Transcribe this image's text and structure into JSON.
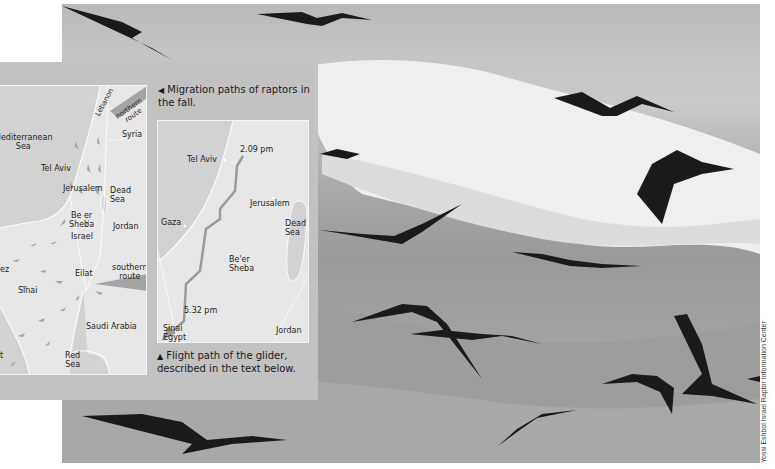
{
  "photo": {
    "subject": "flock of raptors flying over snow-capped mountain",
    "credit": "Yossi Eshbol Israel Raptor Information Center"
  },
  "panel": {
    "migration_caption": {
      "icon": "triangle-left-icon",
      "glyph": "◀",
      "text": "Migration paths of raptors in the fall."
    },
    "glider_caption": {
      "icon": "triangle-up-icon",
      "glyph": "▲",
      "text": "Flight path of the glider, described in the text below."
    }
  },
  "migration_map": {
    "labels": {
      "lebanon": "Lebanon",
      "northern_route_1": "northern",
      "northern_route_2": "route",
      "syria": "Syria",
      "mediterranean_1": "Mediterranean",
      "mediterranean_2": "Sea",
      "tel_aviv": "Tel Aviv",
      "jerusalem": "Jerusalem",
      "dead_sea_1": "Dead",
      "dead_sea_2": "Sea",
      "beer_sheba_1": "Be er",
      "beer_sheba_2": "Sheba",
      "jordan": "Jordan",
      "israel": "Israel",
      "suez": "ez",
      "eilat": "Eilat",
      "southern_route_1": "southern",
      "southern_route_2": "route",
      "sinai": "Sinai",
      "saudi_arabia": "Saudi Arabia",
      "red_sea_1": "Red",
      "red_sea_2": "Sea",
      "partial": "t"
    }
  },
  "glider_map": {
    "labels": {
      "start_time": "2.09 pm",
      "tel_aviv": "Tel Aviv",
      "jerusalem": "Jerusalem",
      "gaza": "Gaza",
      "dead_sea_1": "Dead",
      "dead_sea_2": "Sea",
      "beer_sheba_1": "Be'er",
      "beer_sheba_2": "Sheba",
      "end_time": "5.32 pm",
      "sinai": "Sinai",
      "egypt": "Egypt",
      "jordan": "Jordan"
    }
  },
  "colors": {
    "panel": "#c2c2c2",
    "map_land": "#e7e7e7",
    "map_sea": "#cfcfcf",
    "route": "#9a9a9a"
  }
}
